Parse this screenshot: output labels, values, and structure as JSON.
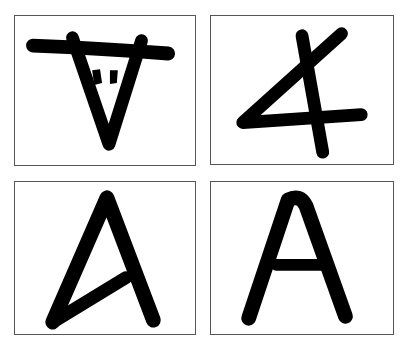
{
  "figure": {
    "panels": [
      {
        "id": 1,
        "label": "Ox-head pictograph (aleph)",
        "glyph": "ox-head"
      },
      {
        "id": 2,
        "label": "Rotated proto-Semitic form",
        "glyph": "rotated-aleph"
      },
      {
        "id": 3,
        "label": "Early Greek alpha",
        "glyph": "early-alpha"
      },
      {
        "id": 4,
        "label": "Modern letter A",
        "glyph": "letter-A"
      }
    ],
    "colors": {
      "ink": "#000000",
      "border": "#555555",
      "background": "#ffffff"
    }
  }
}
